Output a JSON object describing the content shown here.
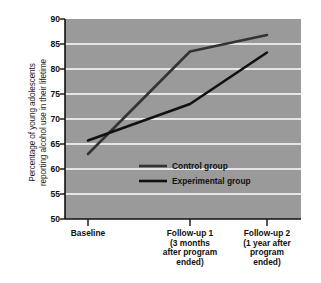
{
  "chart_data": {
    "type": "line",
    "title": "",
    "xlabel": "",
    "ylabel": "Percentage of young adolescents reporting alcohol use in their lifetime",
    "ylabel_lines": [
      "Percentage of young adolescents",
      "reporting alcohol use in their lifetime"
    ],
    "categories": [
      "Baseline",
      "Follow-up 1",
      "Follow-up 2"
    ],
    "category_sublabels": [
      [
        ""
      ],
      [
        "(3 months",
        "after program",
        "ended)"
      ],
      [
        "(1 year after",
        "program",
        "ended)"
      ]
    ],
    "series": [
      {
        "name": "Control group",
        "values": [
          63.0,
          83.5,
          86.8
        ],
        "color": "#333333"
      },
      {
        "name": "Experimental group",
        "values": [
          65.7,
          73.0,
          83.3
        ],
        "color": "#111111"
      }
    ],
    "ylim": [
      50,
      90
    ],
    "yticks": [
      50,
      55,
      60,
      65,
      70,
      75,
      80,
      85,
      90
    ],
    "ytick_labels": [
      "50",
      "55",
      "60",
      "65",
      "70",
      "75",
      "80",
      "85",
      "90"
    ],
    "grid": true,
    "grid_color": "#ffffff",
    "plot_background": "#9a9a9a",
    "legend_position": "inside-center",
    "legend": [
      {
        "label": "Control group"
      },
      {
        "label": "Experimental group"
      }
    ]
  },
  "figure": {
    "background": "#ffffff",
    "axis_color": "#111111"
  }
}
